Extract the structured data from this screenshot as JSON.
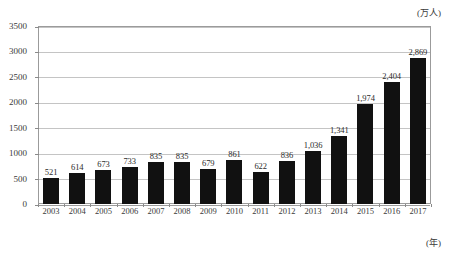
{
  "chart_data": {
    "type": "bar",
    "title": "",
    "subtitle": "",
    "xlabel": "(年)",
    "ylabel": "(万人)",
    "categories": [
      "2003",
      "2004",
      "2005",
      "2006",
      "2007",
      "2008",
      "2009",
      "2010",
      "2011",
      "2012",
      "2013",
      "2014",
      "2015",
      "2016",
      "2017"
    ],
    "values": [
      521,
      614,
      673,
      733,
      835,
      835,
      679,
      861,
      622,
      836,
      1036,
      1341,
      1974,
      2404,
      2869
    ],
    "value_labels": [
      "521",
      "614",
      "673",
      "733",
      "835",
      "835",
      "679",
      "861",
      "622",
      "836",
      "1,036",
      "1,341",
      "1,974",
      "2,404",
      "2,869"
    ],
    "ylim": [
      0,
      3500
    ],
    "ytick_step": 500,
    "ytick_labels": [
      "0",
      "500",
      "1000",
      "1500",
      "2000",
      "2500",
      "3000",
      "3500"
    ],
    "ytick_values": [
      0,
      500,
      1000,
      1500,
      2000,
      2500,
      3000,
      3500
    ],
    "grid": true,
    "grid_axis": "y",
    "legend": false,
    "legend_position": "none",
    "bar_color": "#111111",
    "grid_color": "#c4c4c4",
    "frame_color": "#9b9b9b",
    "text_color": "#3a3a3a",
    "background_color": "#ffffff"
  },
  "axis_captions": {
    "y_unit": "(万人)",
    "x_unit": "(年)"
  }
}
